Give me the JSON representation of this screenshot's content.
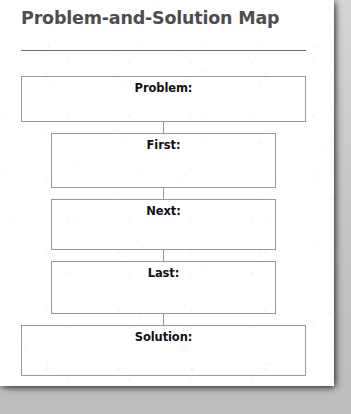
{
  "page": {
    "title": "Problem-and-Solution Map",
    "background_color": "#ffffff",
    "backdrop_color": "#c9c9c9",
    "title_color": "#4e4e50",
    "rule_color": "#6e6e72",
    "box_border_color": "#9a9a9e",
    "label_color": "#111114"
  },
  "diagram": {
    "type": "flowchart",
    "orientation": "vertical",
    "nodes": [
      {
        "label": "Problem:",
        "width": "wide",
        "name": "problem"
      },
      {
        "label": "First:",
        "width": "narrow",
        "name": "first"
      },
      {
        "label": "Next:",
        "width": "narrow",
        "name": "next"
      },
      {
        "label": "Last:",
        "width": "narrow",
        "name": "last"
      },
      {
        "label": "Solution:",
        "width": "wide",
        "name": "solution"
      }
    ],
    "connectors": 4
  }
}
